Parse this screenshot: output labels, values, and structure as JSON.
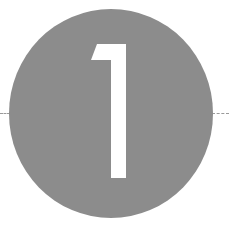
{
  "badge": {
    "number": "1",
    "circle_color": "#8c8c8c",
    "number_color": "#ffffff",
    "guide_line_color": "#9a9a9a"
  }
}
